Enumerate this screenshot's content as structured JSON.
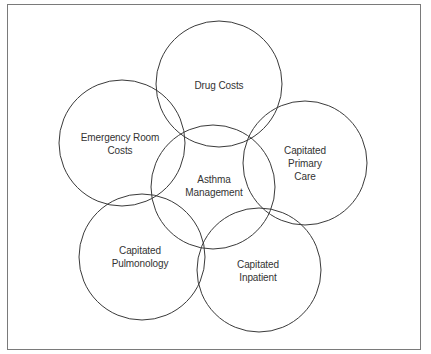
{
  "diagram": {
    "type": "overlapping-circles",
    "stroke_color": "#3a3a3a",
    "frame_color": "#7a7a7a",
    "center": {
      "id": "asthma-management",
      "lines": [
        "Asthma",
        "Management"
      ],
      "cx": 213,
      "cy": 187,
      "r": 62
    },
    "nodes": [
      {
        "id": "drug-costs",
        "lines": [
          "Drug Costs"
        ],
        "cx": 219,
        "cy": 84,
        "r": 63
      },
      {
        "id": "emergency-room-costs",
        "lines": [
          "Emergency Room",
          "Costs"
        ],
        "cx": 122,
        "cy": 143,
        "r": 63
      },
      {
        "id": "capitated-primary-care",
        "lines": [
          "Capitated",
          "Primary",
          "Care"
        ],
        "cx": 305,
        "cy": 163,
        "r": 62
      },
      {
        "id": "capitated-pulmonology",
        "lines": [
          "Capitated",
          "Pulmonology"
        ],
        "cx": 142,
        "cy": 257,
        "r": 63
      },
      {
        "id": "capitated-inpatient",
        "lines": [
          "Capitated",
          "Inpatient"
        ],
        "cx": 259,
        "cy": 270,
        "r": 62
      }
    ]
  }
}
